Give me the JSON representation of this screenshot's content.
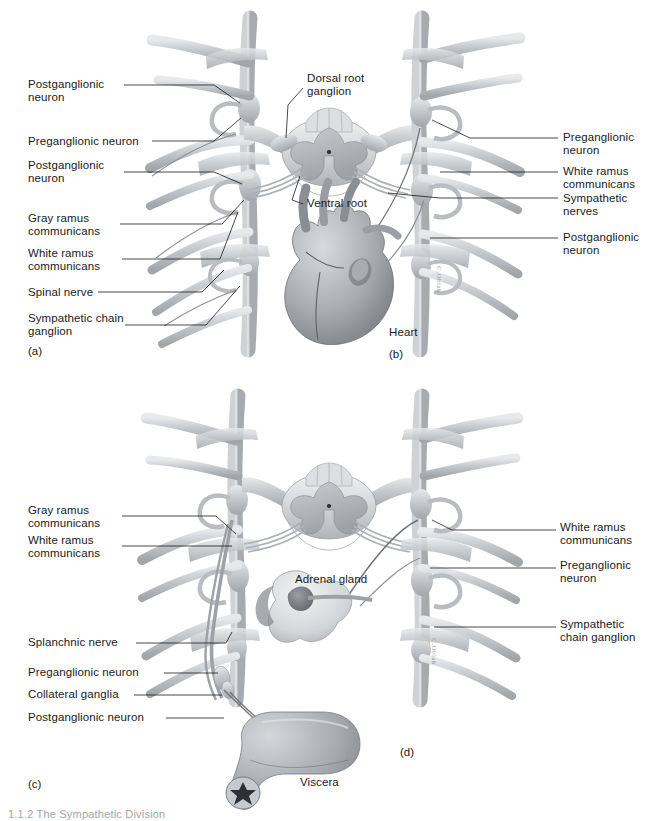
{
  "figure": {
    "background_color": "#ffffff",
    "line_color": "#1a1a1a",
    "anatomy_fill": "#b9bcc0",
    "bottom_caption": "1.1.2  The Sympathetic Division"
  },
  "panels": [
    {
      "id": "(a)",
      "name": "panel-a"
    },
    {
      "id": "(b)",
      "name": "panel-b"
    },
    {
      "id": "(c)",
      "name": "panel-c"
    },
    {
      "id": "(d)",
      "name": "panel-d"
    }
  ],
  "labels": {
    "a": [
      {
        "text": "Postganglionic\nneuron",
        "x": 28,
        "y": 78
      },
      {
        "text": "Preganglionic neuron",
        "x": 28,
        "y": 137
      },
      {
        "text": "Postganglionic\nneuron",
        "x": 28,
        "y": 163
      },
      {
        "text": "Gray ramus\ncommunicans",
        "x": 28,
        "y": 216
      },
      {
        "text": "White ramus\ncommunicans",
        "x": 28,
        "y": 251
      },
      {
        "text": "Spinal nerve",
        "x": 28,
        "y": 288
      },
      {
        "text": "Sympathetic chain\nganglion",
        "x": 28,
        "y": 312
      }
    ],
    "b_center": [
      {
        "text": "Dorsal root\nganglion",
        "x": 307,
        "y": 74
      },
      {
        "text": "Ventral root",
        "x": 307,
        "y": 199
      },
      {
        "text": "Heart",
        "x": 389,
        "y": 330
      }
    ],
    "b_right": [
      {
        "text": "Preganglionic\nneuron",
        "x": 563,
        "y": 133
      },
      {
        "text": "White ramus\ncommunicans",
        "x": 563,
        "y": 166
      },
      {
        "text": "Sympathetic\nnerves",
        "x": 563,
        "y": 193
      },
      {
        "text": "Postganglionic\nneuron",
        "x": 563,
        "y": 232
      }
    ],
    "c": [
      {
        "text": "Gray ramus\ncommunicans",
        "x": 28,
        "y": 508
      },
      {
        "text": "White ramus\ncommunicans",
        "x": 28,
        "y": 538
      },
      {
        "text": "Splanchnic nerve",
        "x": 28,
        "y": 637
      },
      {
        "text": "Preganglionic neuron",
        "x": 28,
        "y": 667
      },
      {
        "text": "Collateral ganglia",
        "x": 28,
        "y": 689
      },
      {
        "text": "Postganglionic neuron",
        "x": 28,
        "y": 712
      }
    ],
    "d_center": [
      {
        "text": "Adrenal gland",
        "x": 295,
        "y": 575
      },
      {
        "text": "Viscera",
        "x": 300,
        "y": 778
      }
    ],
    "d_right": [
      {
        "text": "White ramus\ncommunicans",
        "x": 560,
        "y": 523
      },
      {
        "text": "Preganglionic\nneuron",
        "x": 560,
        "y": 561
      },
      {
        "text": "Sympathetic\nchain ganglion",
        "x": 560,
        "y": 620
      }
    ]
  },
  "panel_ids": [
    {
      "id": "(a)",
      "x": 28,
      "y": 345
    },
    {
      "id": "(b)",
      "x": 389,
      "y": 348
    },
    {
      "id": "(c)",
      "x": 28,
      "y": 778
    },
    {
      "id": "(d)",
      "x": 400,
      "y": 746
    }
  ],
  "signatures": [
    {
      "text": "C.Oblak",
      "x": 437,
      "y": 268
    },
    {
      "text": "C.Oblak",
      "x": 432,
      "y": 640
    }
  ],
  "anatomy": {
    "spinal_cord_upper": "cross-section of spinal cord with gray matter butterfly",
    "spinal_cord_lower": "cross-section of spinal cord with gray matter butterfly",
    "heart": "heart with great vessels",
    "adrenal_gland": "adrenal gland sectioned showing medulla",
    "viscera": "segment of intestine"
  }
}
